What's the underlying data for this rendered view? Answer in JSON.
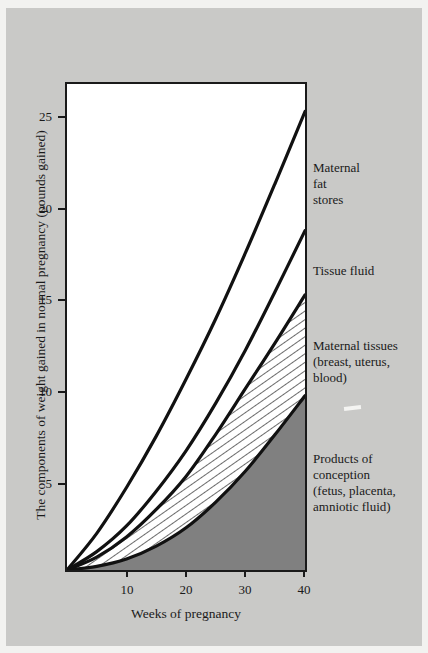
{
  "figure": {
    "background_color": "#c9c9c7",
    "plot_background_color": "#ffffff",
    "frame_color": "#1a1a1a"
  },
  "chart_data": {
    "type": "area",
    "title": "",
    "xlabel": "Weeks of pregnancy",
    "ylabel": "The components of weight gained in normal pregnancy (pounds gained)",
    "xlim": [
      0,
      40
    ],
    "ylim": [
      0,
      26.5
    ],
    "xticks": [
      10,
      20,
      30,
      40
    ],
    "xticklabels": [
      "10",
      "20",
      "30",
      "40"
    ],
    "yticks": [
      5,
      10,
      15,
      20,
      25
    ],
    "yticklabels": [
      "5",
      "10",
      "15",
      "20",
      "25"
    ],
    "grid": false,
    "legend_position": "right-annotations",
    "x": [
      0,
      5,
      10,
      15,
      20,
      25,
      30,
      35,
      40
    ],
    "series": [
      {
        "name": "Products of conception (fetus, placenta, amniotic fluid)",
        "label": "Products of\nconception\n(fetus, placenta,\namniotic fluid)",
        "fill": "solid-gray",
        "fill_color": "#808080",
        "cumulative_values": [
          0,
          0.2,
          0.6,
          1.3,
          2.3,
          3.7,
          5.4,
          7.4,
          9.5
        ]
      },
      {
        "name": "Maternal tissues (breast, uterus, blood)",
        "label": "Maternal tissues\n(breast, uterus,\nblood)",
        "fill": "diagonal-hatch",
        "fill_color": "#ffffff",
        "cumulative_values": [
          0,
          0.7,
          1.8,
          3.3,
          5.1,
          7.4,
          9.9,
          12.4,
          15.0
        ]
      },
      {
        "name": "Tissue fluid",
        "label": "Tissue fluid",
        "fill": "none",
        "cumulative_values": [
          0,
          1.0,
          2.4,
          4.3,
          6.5,
          9.1,
          12.0,
          15.2,
          18.5
        ]
      },
      {
        "name": "Maternal fat stores",
        "label": "Maternal\nfat\nstores",
        "fill": "none",
        "cumulative_values": [
          0,
          2.0,
          4.5,
          7.3,
          10.4,
          13.7,
          17.3,
          21.1,
          25.0
        ]
      }
    ]
  },
  "annotations": {
    "maternal_fat_stores": "Maternal\nfat\nstores",
    "tissue_fluid": "Tissue fluid",
    "maternal_tissues": "Maternal tissues\n(breast, uterus,\nblood)",
    "products_of_conception": "Products of\nconception\n(fetus, placenta,\namniotic fluid)"
  },
  "axes": {
    "y_title": "The components of weight gained in normal pregnancy (pounds gained)",
    "x_title": "Weeks of pregnancy",
    "y_labels": [
      "25",
      "20",
      "15",
      "10",
      "5"
    ],
    "x_labels": [
      "10",
      "20",
      "30",
      "40"
    ]
  }
}
